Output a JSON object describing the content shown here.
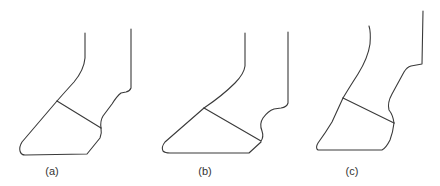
{
  "figure": {
    "line_color": "#3a3a3a",
    "background": "#ffffff",
    "panels": [
      {
        "id": "a",
        "label": "(a)"
      },
      {
        "id": "b",
        "label": "(b)"
      },
      {
        "id": "c",
        "label": "(c)"
      }
    ]
  }
}
